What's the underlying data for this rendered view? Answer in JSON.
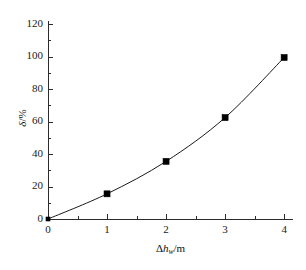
{
  "chart_data": {
    "type": "line",
    "title": "",
    "subtitle": "",
    "xlabel": "Δhₕ /m",
    "xlabel_parts": {
      "delta": "Δ",
      "var": "h",
      "subscript": "w",
      "unit": "/m"
    },
    "ylabel": "δ/%",
    "ylabel_parts": {
      "symbol": "δ",
      "unit": "/%"
    },
    "x": [
      0,
      1,
      2,
      3,
      4
    ],
    "values": [
      0,
      15.5,
      35.5,
      62.5,
      99.5
    ],
    "series": [
      {
        "name": "δ",
        "values": [
          0,
          15.5,
          35.5,
          62.5,
          99.5
        ]
      }
    ],
    "xlim": [
      0,
      4.15
    ],
    "ylim": [
      0,
      122
    ],
    "xticks": [
      0,
      1,
      2,
      3,
      4
    ],
    "yticks": [
      0,
      20,
      40,
      60,
      80,
      100,
      120
    ],
    "xtick_labels": [
      "0",
      "1",
      "2",
      "3",
      "4"
    ],
    "ytick_labels": [
      "0",
      "20",
      "40",
      "60",
      "80",
      "100",
      "120"
    ],
    "x_minor_ticks": [
      0.5,
      1.5,
      2.5,
      3.5
    ],
    "y_minor_ticks": [
      10,
      30,
      50,
      70,
      90,
      110
    ],
    "grid": false,
    "legend": false,
    "legend_position": "none",
    "marker": "filled-square",
    "marker_color": "#000000",
    "line_color": "#1a1a1a",
    "axis_color": "#2b2b2b",
    "background_color": "#ffffff",
    "tick_direction": "in",
    "frame": "left-bottom",
    "annotations": []
  }
}
